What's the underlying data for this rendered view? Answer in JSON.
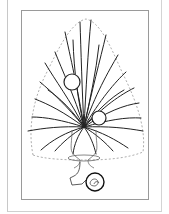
{
  "figure": {
    "colors": {
      "line": "#222222",
      "dashed_outline": "#999999",
      "frame": "#9a9a9a",
      "background": "#ffffff"
    },
    "elements": {
      "stems_count": 30,
      "ornaments": 3
    }
  }
}
